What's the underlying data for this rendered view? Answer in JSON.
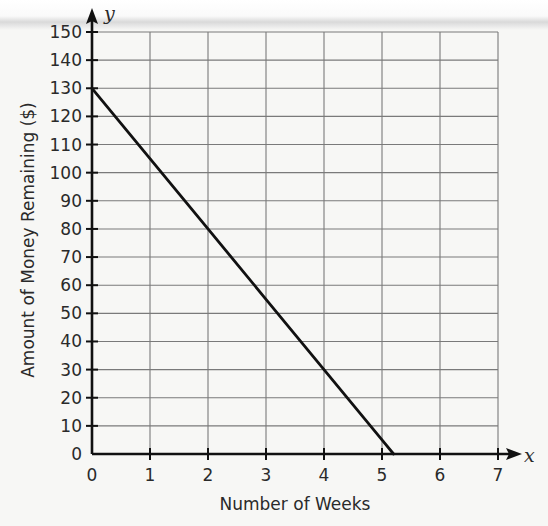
{
  "chart_data": {
    "type": "line",
    "title": "",
    "xlabel": "Number of Weeks",
    "ylabel": "Amount of Money Remaining ($)",
    "x_axis_var": "x",
    "y_axis_var": "y",
    "xlim": [
      0,
      7
    ],
    "ylim": [
      0,
      150
    ],
    "x_ticks": [
      "0",
      "1",
      "2",
      "3",
      "4",
      "5",
      "6",
      "7"
    ],
    "y_ticks": [
      "0",
      "10",
      "20",
      "30",
      "40",
      "50",
      "60",
      "70",
      "80",
      "90",
      "100",
      "110",
      "120",
      "130",
      "140",
      "150"
    ],
    "grid": true,
    "legend": null,
    "series": [
      {
        "name": "Money remaining",
        "equation": "y = 130 - 25x",
        "x": [
          0,
          1,
          2,
          3,
          4,
          5,
          5.2
        ],
        "y": [
          130,
          105,
          80,
          55,
          30,
          5,
          0
        ]
      }
    ],
    "colors": {
      "line": "#111111",
      "grid": "#7a7a7a",
      "axis": "#111111"
    }
  }
}
